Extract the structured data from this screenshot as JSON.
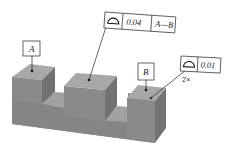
{
  "diagram": {
    "type": "gdt-profile-of-surface",
    "datums": [
      {
        "id": "A",
        "label": "A"
      },
      {
        "id": "B",
        "label": "B"
      }
    ],
    "feature_control_frames": [
      {
        "id": "fcf-center",
        "symbol": "profile-of-surface",
        "tolerance": "0.04",
        "datum_reference": "A—B"
      },
      {
        "id": "fcf-right",
        "symbol": "profile-of-surface",
        "tolerance": "0.01",
        "multiplier": "2×"
      }
    ],
    "colors": {
      "part_top": "#a9a9a9",
      "part_front": "#8c8c8c",
      "part_side": "#767676",
      "lines": "#222222"
    }
  }
}
